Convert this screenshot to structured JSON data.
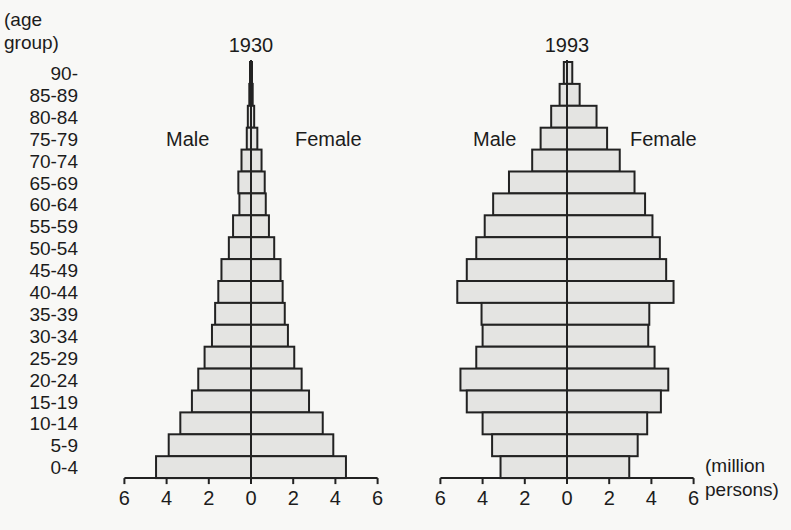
{
  "chart_data": [
    {
      "type": "bar",
      "orientation": "horizontal-population-pyramid",
      "title": "1930",
      "xlabel": "(million persons)",
      "ylabel": "(age group)",
      "categories": [
        "90-",
        "85-89",
        "80-84",
        "75-79",
        "70-74",
        "65-69",
        "60-64",
        "55-59",
        "50-54",
        "45-49",
        "40-44",
        "35-39",
        "30-34",
        "25-29",
        "20-24",
        "15-19",
        "10-14",
        "5-9",
        "0-4"
      ],
      "series": [
        {
          "name": "Male",
          "values": [
            0.03,
            0.08,
            0.15,
            0.2,
            0.45,
            0.6,
            0.55,
            0.85,
            1.05,
            1.4,
            1.55,
            1.7,
            1.85,
            2.2,
            2.5,
            2.8,
            3.35,
            3.9,
            4.5
          ]
        },
        {
          "name": "Female",
          "values": [
            0.03,
            0.08,
            0.15,
            0.3,
            0.5,
            0.65,
            0.7,
            0.85,
            1.1,
            1.4,
            1.5,
            1.6,
            1.75,
            2.05,
            2.4,
            2.75,
            3.4,
            3.9,
            4.5
          ]
        }
      ],
      "xticks": [
        6,
        4,
        2,
        0,
        2,
        4,
        6
      ],
      "xlim": [
        -6,
        6
      ],
      "grid": false,
      "legend": "side labels: Male (left), Female (right)"
    },
    {
      "type": "bar",
      "orientation": "horizontal-population-pyramid",
      "title": "1993",
      "xlabel": "(million persons)",
      "ylabel": "(age group)",
      "categories": [
        "90-",
        "85-89",
        "80-84",
        "75-79",
        "70-74",
        "65-69",
        "60-64",
        "55-59",
        "50-54",
        "45-49",
        "40-44",
        "35-39",
        "30-34",
        "25-29",
        "20-24",
        "15-19",
        "10-14",
        "5-9",
        "0-4"
      ],
      "series": [
        {
          "name": "Male",
          "values": [
            0.15,
            0.35,
            0.75,
            1.25,
            1.65,
            2.75,
            3.5,
            3.9,
            4.3,
            4.75,
            5.2,
            4.05,
            4.0,
            4.3,
            5.05,
            4.75,
            4.0,
            3.55,
            3.15
          ]
        },
        {
          "name": "Female",
          "values": [
            0.25,
            0.6,
            1.4,
            1.9,
            2.5,
            3.2,
            3.7,
            4.05,
            4.4,
            4.7,
            5.05,
            3.9,
            3.85,
            4.15,
            4.8,
            4.45,
            3.8,
            3.35,
            2.95
          ]
        }
      ],
      "xticks": [
        6,
        4,
        2,
        0,
        2,
        4,
        6
      ],
      "xlim": [
        -6,
        6
      ],
      "grid": false,
      "legend": "side labels: Male (left), Female (right)"
    }
  ],
  "labels": {
    "age_axis_title_line1": "(age",
    "age_axis_title_line2": "group)",
    "unit_line1": "(million",
    "unit_line2": "persons)",
    "male": "Male",
    "female": "Female"
  },
  "colors": {
    "bar_fill": "#e4e4e2",
    "bar_stroke": "#222222",
    "background": "#f8f8f6"
  }
}
